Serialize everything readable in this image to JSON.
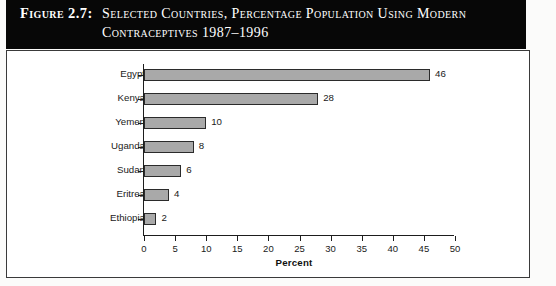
{
  "figure": {
    "label": "Figure 2.7:",
    "title_line_1": "Selected Countries, Percentage Population Using Modern",
    "title_line_2": "Contraceptives 1987–1996",
    "title_bar_color": "#070707",
    "bar_fill_color": "#a9a9a9",
    "bar_border_color": "#2b2b2b"
  },
  "chart_data": {
    "type": "bar",
    "orientation": "horizontal",
    "title": "Figure 2.7: Selected Countries, Percentage Population Using Modern Contraceptives 1987–1996",
    "categories": [
      "Egypt",
      "Kenya",
      "Yemen",
      "Uganda",
      "Sudan",
      "Eritrea",
      "Ethiopia"
    ],
    "values": [
      46,
      28,
      10,
      8,
      6,
      4,
      2
    ],
    "data_labels": [
      "46",
      "28",
      "10",
      "8",
      "6",
      "4",
      "2"
    ],
    "xlabel": "Percent",
    "ylabel": "",
    "xlim": [
      0,
      50
    ],
    "xticks": [
      0,
      5,
      10,
      15,
      20,
      25,
      30,
      35,
      40,
      45,
      50
    ],
    "xtick_labels": [
      "0",
      "5",
      "10",
      "15",
      "20",
      "25",
      "30",
      "35",
      "40",
      "45",
      "50"
    ],
    "grid": false,
    "legend": false
  }
}
